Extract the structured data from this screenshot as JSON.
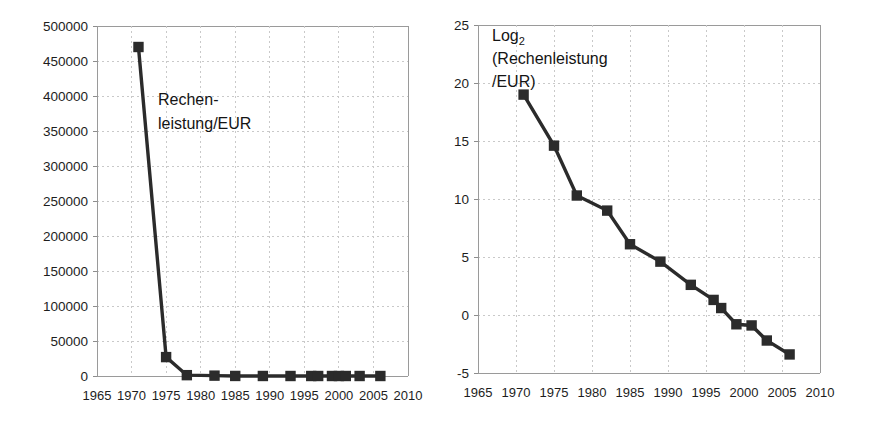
{
  "figure": {
    "background_color": "#ffffff",
    "marker_color": "#2b2b2b",
    "grid_color": "#c9c9c9",
    "axis_color": "#9a9a9a"
  },
  "chart_data": [
    {
      "id": "linear",
      "type": "line",
      "title": "",
      "subtitle": "",
      "series_label_lines": [
        "Rechen-",
        "leistung/EUR"
      ],
      "series_label": "Rechenleistung/EUR",
      "xlabel": "",
      "ylabel": "",
      "legend_position": "inside-plot",
      "grid": true,
      "xlim": [
        1965,
        2010
      ],
      "ylim": [
        0,
        500000
      ],
      "xticks": [
        1965,
        1970,
        1975,
        1980,
        1985,
        1990,
        1995,
        2000,
        2005,
        2010
      ],
      "xtick_labels": [
        "1965",
        "1970",
        "1975",
        "1980",
        "1985",
        "1990",
        "1995",
        "2000",
        "2005",
        "2010"
      ],
      "yticks": [
        0,
        50000,
        100000,
        150000,
        200000,
        250000,
        300000,
        350000,
        400000,
        450000,
        500000
      ],
      "ytick_labels": [
        "0",
        "50000",
        "100000",
        "150000",
        "200000",
        "250000",
        "300000",
        "350000",
        "400000",
        "450000",
        "500000"
      ],
      "series": [
        {
          "name": "Rechenleistung/EUR",
          "x": [
            1971,
            1975,
            1978,
            1982,
            1985,
            1989,
            1993,
            1996,
            1997,
            1999,
            2000,
            2001,
            2003,
            2006
          ],
          "y": [
            470000,
            27000,
            1200,
            520,
            70,
            25,
            6,
            2.6,
            1.5,
            0.6,
            0.5,
            0.35,
            0.2,
            0.1
          ]
        }
      ]
    },
    {
      "id": "log2",
      "type": "line",
      "title": "",
      "subtitle": "",
      "series_label_lines": [
        "Log2",
        "(Rechenleistung",
        "/EUR)"
      ],
      "series_label": "Log2(Rechenleistung/EUR)",
      "series_label_base": "Log",
      "series_label_subscript": "2",
      "xlabel": "",
      "ylabel": "",
      "legend_position": "inside-plot",
      "grid": true,
      "xlim": [
        1965,
        2010
      ],
      "ylim": [
        -5,
        25
      ],
      "xticks": [
        1965,
        1970,
        1975,
        1980,
        1985,
        1990,
        1995,
        2000,
        2005,
        2010
      ],
      "xtick_labels": [
        "1965",
        "1970",
        "1975",
        "1980",
        "1985",
        "1990",
        "1995",
        "2000",
        "2005",
        "2010"
      ],
      "yticks": [
        -5,
        0,
        5,
        10,
        15,
        20,
        25
      ],
      "ytick_labels": [
        "-5",
        "0",
        "5",
        "10",
        "15",
        "20",
        "25"
      ],
      "series": [
        {
          "name": "Log2(Rechenleistung/EUR)",
          "x": [
            1971,
            1975,
            1978,
            1982,
            1985,
            1989,
            1993,
            1996,
            1997,
            1999,
            2001,
            2003,
            2006
          ],
          "y": [
            19.0,
            14.6,
            10.3,
            9.0,
            6.1,
            4.6,
            2.6,
            1.3,
            0.6,
            -0.8,
            -0.9,
            -2.2,
            -3.4
          ]
        }
      ]
    }
  ]
}
